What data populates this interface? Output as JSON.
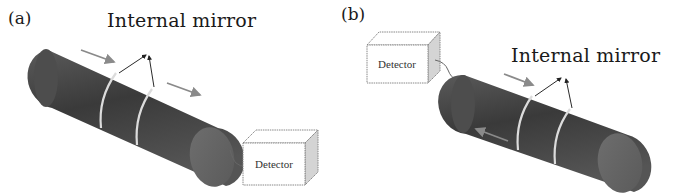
{
  "figure": {
    "panels": [
      {
        "id": "a",
        "label": "(a)",
        "mirror_label": "Internal mirror",
        "detector_label": "Detector",
        "detector_position": "right-end",
        "arrows": [
          "forward-top-left",
          "forward-top-right"
        ]
      },
      {
        "id": "b",
        "label": "(b)",
        "mirror_label": "Internal mirror",
        "detector_label": "Detector",
        "detector_position": "left-end",
        "arrows": [
          "forward-top",
          "backward-bottom-left"
        ]
      }
    ],
    "colors": {
      "fiber": "#4a4a4a",
      "fiber_end": "#6a6a6a",
      "ring": "#d8d8d8",
      "arrow": "#8a8a8a",
      "pointer": "#2a2a2a",
      "detector_border": "#777777",
      "detector_side": "#cfcfcf"
    }
  }
}
